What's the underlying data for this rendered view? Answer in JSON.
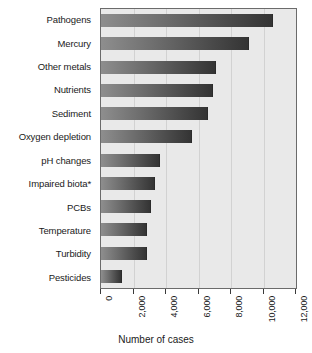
{
  "chart_data": {
    "type": "bar",
    "orientation": "horizontal",
    "title": "",
    "xlabel": "Number of cases",
    "ylabel": "",
    "categories": [
      "Pathogens",
      "Mercury",
      "Other metals",
      "Nutrients",
      "Sediment",
      "Oxygen depletion",
      "pH changes",
      "Impaired biota*",
      "PCBs",
      "Temperature",
      "Turbidity",
      "Pesticides"
    ],
    "values": [
      10600,
      9100,
      7100,
      6900,
      6600,
      5600,
      3650,
      3350,
      3050,
      2850,
      2800,
      1300
    ],
    "xlim": [
      0,
      12000
    ],
    "xticks": [
      0,
      2000,
      4000,
      6000,
      8000,
      10000,
      12000
    ],
    "xtick_labels": [
      "0",
      "2,000",
      "4,000",
      "6,000",
      "8,000",
      "10,000",
      "12,000"
    ],
    "grid": true,
    "grid_axis": "x",
    "legend": null,
    "bar_color_start": "#8e8e8e",
    "bar_color_end": "#343434",
    "plot_background": "#e9e9e9",
    "gridline_color": "#d2d2d2",
    "axis_color": "#6b6b6b",
    "tick_label_rotation": -90
  }
}
